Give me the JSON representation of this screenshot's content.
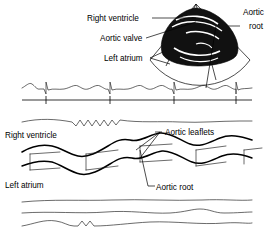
{
  "figure": {
    "background_color": "#ffffff",
    "ink_color": "#000000",
    "width": 275,
    "height": 238
  },
  "panels": {
    "two_d_echo": {
      "name": "2D echocardiogram sector image",
      "sector_fill": "#ffffff",
      "echo_blob_color": "#111111",
      "labels": [
        {
          "id": "right-ventricle",
          "text": "Right ventricle",
          "x": 87,
          "y": 21,
          "anchor": "start"
        },
        {
          "id": "aortic-valve",
          "text": "Aortic valve",
          "x": 100,
          "y": 41,
          "anchor": "start"
        },
        {
          "id": "left-atrium",
          "text": "Left atrium",
          "x": 104,
          "y": 61,
          "anchor": "start"
        },
        {
          "id": "aortic-root-line1",
          "text": "Aortic",
          "x": 243,
          "y": 15,
          "anchor": "start"
        },
        {
          "id": "aortic-root-line2",
          "text": "root",
          "x": 249,
          "y": 29,
          "anchor": "start"
        }
      ]
    },
    "ecg": {
      "name": "ECG rhythm strip",
      "beats": 4,
      "baseline_y": 100,
      "tick_positions": [
        46,
        110,
        174,
        236
      ]
    },
    "m_mode": {
      "name": "M-mode tracing",
      "labels": [
        {
          "id": "right-ventricle",
          "text": "Right ventricle",
          "x": 5,
          "y": 138,
          "anchor": "start"
        },
        {
          "id": "left-atrium",
          "text": "Left atrium",
          "x": 5,
          "y": 188,
          "anchor": "start"
        },
        {
          "id": "aortic-leaflets",
          "text": "Aortic leaflets",
          "x": 163,
          "y": 135,
          "anchor": "start"
        },
        {
          "id": "aortic-root",
          "text": "Aortic root",
          "x": 152,
          "y": 190,
          "anchor": "start"
        }
      ]
    }
  }
}
